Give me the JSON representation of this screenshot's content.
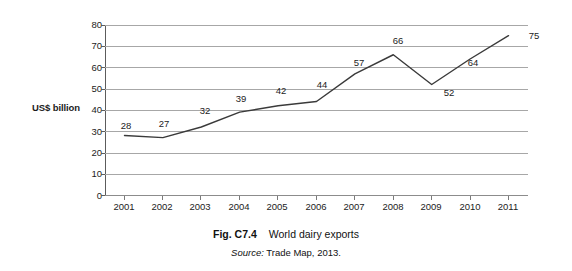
{
  "chart_data": {
    "type": "line",
    "title": "World dairy exports",
    "xlabel": "",
    "ylabel": "US$ billion",
    "ylim": [
      0,
      80
    ],
    "yticks": [
      0,
      10,
      20,
      30,
      40,
      50,
      60,
      70,
      80
    ],
    "grid": true,
    "legend": "none",
    "categories": [
      "2001",
      "2002",
      "2003",
      "2004",
      "2005",
      "2006",
      "2007",
      "2008",
      "2009",
      "2010",
      "2011"
    ],
    "values": [
      28,
      27,
      32,
      39,
      42,
      44,
      57,
      66,
      52,
      64,
      75
    ],
    "point_labels": [
      "28",
      "27",
      "32",
      "39",
      "42",
      "44",
      "57",
      "66",
      "52",
      "64",
      "75"
    ],
    "series": [
      {
        "name": "World dairy exports",
        "values": [
          28,
          27,
          32,
          39,
          42,
          44,
          57,
          66,
          52,
          64,
          75
        ],
        "color": "#3a3a3a"
      }
    ]
  },
  "axis": {
    "y_title": "US$ billion",
    "tick_labels": [
      "80",
      "70",
      "60",
      "50",
      "40",
      "30",
      "20",
      "10",
      "0"
    ],
    "x_labels": [
      "2001",
      "2002",
      "2003",
      "2004",
      "2005",
      "2006",
      "2007",
      "2008",
      "2009",
      "2010",
      "2011"
    ]
  },
  "caption": {
    "number": "Fig. C7.4",
    "text": "World dairy exports"
  },
  "source": {
    "label": "Source:",
    "text": "Trade Map, 2013."
  },
  "colors": {
    "line": "#3a3a3a",
    "gridline": "#a7a7a7",
    "axis": "#5c5c5c",
    "text": "#1c1c1c",
    "background": "#ffffff"
  }
}
